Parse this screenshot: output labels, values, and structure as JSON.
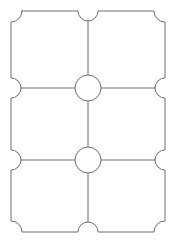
{
  "document": {
    "type": "die-cut-label-template",
    "title": "2 x 3 Rounded-Notch Label Grid Template",
    "description": "Outline drawing of a six-up label sheet with concave quarter-circle corners, semicircular notches at every edge midpoint, and full circles at the interior grid intersections."
  },
  "canvas": {
    "width": 176,
    "height": 243,
    "background_color": "#ffffff"
  },
  "style": {
    "stroke_color": "#6d6d6d",
    "stroke_width": 1,
    "fill_color": "#ffffff"
  },
  "geometry": {
    "outer_rect": {
      "left": 11,
      "top": 11,
      "right": 165,
      "bottom": 232
    },
    "corner_radius": 11,
    "edge_notch_radius": 10,
    "intersection_circle_radius": 13,
    "grid": {
      "columns": 2,
      "rows": 3,
      "vertical_divider_x": [
        88
      ],
      "horizontal_divider_y": [
        88,
        160
      ]
    },
    "edge_notches": {
      "top": [
        {
          "cx": 88,
          "cy": 11
        }
      ],
      "bottom": [
        {
          "cx": 88,
          "cy": 232
        }
      ],
      "left": [
        {
          "cx": 11,
          "cy": 88
        },
        {
          "cx": 11,
          "cy": 160
        }
      ],
      "right": [
        {
          "cx": 165,
          "cy": 88
        },
        {
          "cx": 165,
          "cy": 160
        }
      ]
    },
    "intersections": [
      {
        "cx": 88,
        "cy": 88
      },
      {
        "cx": 88,
        "cy": 160
      }
    ],
    "divider_segments": [
      {
        "name": "vertical-top",
        "x1": 88,
        "y1": 21,
        "x2": 88,
        "y2": 75
      },
      {
        "name": "vertical-middle",
        "x1": 88,
        "y1": 101,
        "x2": 88,
        "y2": 147
      },
      {
        "name": "vertical-bottom",
        "x1": 88,
        "y1": 173,
        "x2": 88,
        "y2": 222
      },
      {
        "name": "horizontal-upper-left",
        "x1": 21,
        "y1": 88,
        "x2": 75,
        "y2": 88
      },
      {
        "name": "horizontal-upper-right",
        "x1": 101,
        "y1": 88,
        "x2": 155,
        "y2": 88
      },
      {
        "name": "horizontal-lower-left",
        "x1": 21,
        "y1": 160,
        "x2": 75,
        "y2": 160
      },
      {
        "name": "horizontal-lower-right",
        "x1": 101,
        "y1": 160,
        "x2": 155,
        "y2": 160
      }
    ],
    "outline_path": "M 22 11 L 78 11 A 10 10 0 0 0 98 11 L 154 11 A 11 11 0 0 0 165 22 L 165 78 A 10 10 0 0 0 165 98 L 165 150 A 10 10 0 0 0 165 170 L 165 221 A 11 11 0 0 0 154 232 L 98 232 A 10 10 0 0 0 78 232 L 22 232 A 11 11 0 0 0 11 221 L 11 170 A 10 10 0 0 0 11 150 L 11 98 A 10 10 0 0 0 11 78 L 11 22 A 11 11 0 0 0 22 11 Z"
  }
}
